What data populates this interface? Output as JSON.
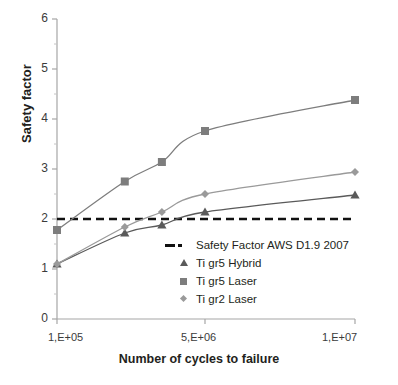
{
  "chart_data": {
    "type": "line",
    "title": "",
    "xlabel": "Number of cycles to failure",
    "ylabel": "Safety factor",
    "xlim": [
      100000,
      10000000
    ],
    "ylim": [
      0,
      6
    ],
    "x_tick_labels": [
      "1,E+05",
      "5,E+06",
      "1,E+07"
    ],
    "x_tick_values": [
      100000,
      5000000,
      10000000
    ],
    "y_tick_labels": [
      "0",
      "1",
      "2",
      "3",
      "4",
      "5",
      "6"
    ],
    "y_tick_values": [
      0,
      1,
      2,
      3,
      4,
      5,
      6
    ],
    "y_minor_step": 0.5,
    "grid": false,
    "legend_position": "inside-center-lower",
    "reference_line": {
      "label": "Safety Factor AWS D1.9 2007",
      "value": 2.0,
      "style": "dashed",
      "color": "#111111"
    },
    "series": [
      {
        "name": "Ti gr5 Hybrid",
        "marker": "triangle",
        "color": "#5a5a5a",
        "x": [
          100000,
          600000,
          1600000,
          5000000,
          10000000
        ],
        "y": [
          1.1,
          1.72,
          1.88,
          2.14,
          2.48
        ]
      },
      {
        "name": "Ti gr5 Laser",
        "marker": "square",
        "color": "#7d7d7d",
        "x": [
          100000,
          600000,
          1600000,
          5000000,
          10000000
        ],
        "y": [
          1.78,
          2.75,
          3.14,
          3.76,
          4.38
        ]
      },
      {
        "name": "Ti gr2 Laser",
        "marker": "diamond",
        "color": "#9a9a9a",
        "x": [
          100000,
          600000,
          1600000,
          5000000,
          10000000
        ],
        "y": [
          1.1,
          1.84,
          2.14,
          2.5,
          2.94
        ]
      }
    ]
  },
  "axes": {
    "y_label": "Safety factor",
    "x_label": "Number of cycles to failure"
  },
  "legend": {
    "items": [
      {
        "label": "Safety Factor AWS D1.9 2007",
        "key": "dashed-line-key"
      },
      {
        "label": "Ti gr5 Hybrid",
        "key": "triangle-marker-key"
      },
      {
        "label": "Ti gr5 Laser",
        "key": "square-marker-key"
      },
      {
        "label": "Ti gr2 Laser",
        "key": "diamond-marker-key"
      }
    ]
  }
}
